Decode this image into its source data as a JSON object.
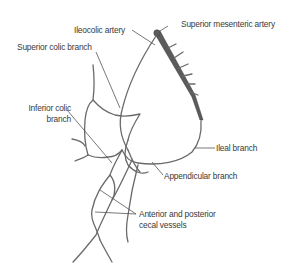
{
  "diagram": {
    "colors": {
      "background": "#ffffff",
      "vessel": "#6a6a6a",
      "superior_mesenteric": "#5b5b5b",
      "label_text": "#3a3a3a"
    },
    "labels": {
      "ileocolic_artery": "Ileocolic artery",
      "superior_mesenteric_artery": "Superior mesenteric artery",
      "superior_colic_branch": "Superior colic branch",
      "inferior_colic_branch_line1": "Inferior colic",
      "inferior_colic_branch_line2": "branch",
      "ileal_branch": "Ileal branch",
      "appendicular_branch": "Appendicular branch",
      "cecal_vessels_line1": "Anterior and posterior",
      "cecal_vessels_line2": "cecal vessels"
    }
  }
}
